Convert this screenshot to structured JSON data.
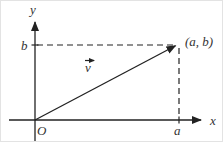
{
  "figure": {
    "type": "vector-diagram",
    "background": "#ffffff",
    "ink_color": "#222222",
    "label_color": "#333333",
    "labels": {
      "y_axis": "y",
      "x_axis": "x",
      "origin": "O",
      "b_tick": "b",
      "a_tick": "a",
      "point": "(a, b)",
      "vector": "v"
    }
  }
}
